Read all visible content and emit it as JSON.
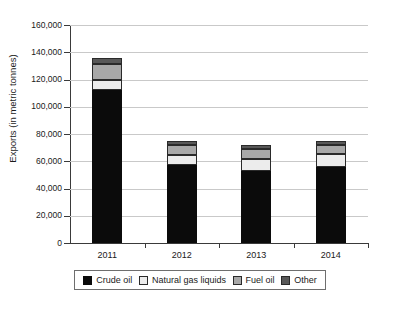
{
  "chart_data": {
    "type": "bar",
    "subtype": "stacked-vertical",
    "title": "",
    "xlabel": "",
    "ylabel": "Exports (in metric tonnes)",
    "categories": [
      "2011",
      "2012",
      "2013",
      "2014"
    ],
    "ylim": [
      0,
      160000
    ],
    "ytick_labels": [
      "160,000",
      "140,000",
      "120,000",
      "100,000",
      "80,000",
      "60,000",
      "40,000",
      "20,000",
      "0"
    ],
    "ytick_values": [
      160000,
      140000,
      120000,
      100000,
      80000,
      60000,
      40000,
      20000,
      0
    ],
    "grid": true,
    "grid_axis": "y",
    "legend_position": "bottom",
    "series": [
      {
        "name": "Crude oil",
        "color": "#0b0b0b",
        "values": [
          112000,
          57500,
          52500,
          55500
        ]
      },
      {
        "name": "Natural gas liquids",
        "color": "#ececec",
        "values": [
          7500,
          7000,
          9000,
          9500
        ]
      },
      {
        "name": "Fuel oil",
        "color": "#a8a8a8",
        "values": [
          12000,
          7500,
          7500,
          7000
        ]
      },
      {
        "name": "Other",
        "color": "#585858",
        "values": [
          4500,
          3000,
          3000,
          3000
        ]
      }
    ],
    "totals": [
      136000,
      75000,
      72000,
      75000
    ]
  },
  "legend": {
    "items": [
      {
        "label": "Crude oil",
        "swatch": "crude"
      },
      {
        "label": "Natural gas liquids",
        "swatch": "ngl"
      },
      {
        "label": "Fuel oil",
        "swatch": "fuel"
      },
      {
        "label": "Other",
        "swatch": "other"
      }
    ]
  }
}
